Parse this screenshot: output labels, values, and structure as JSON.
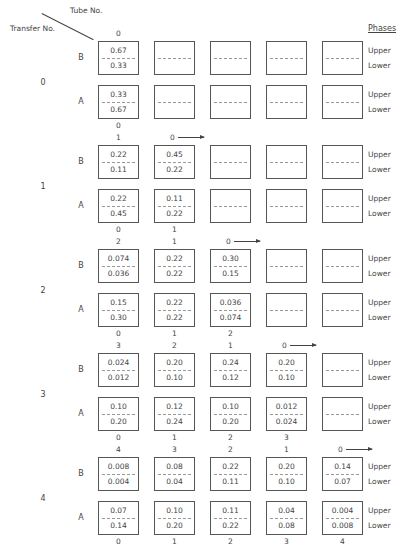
{
  "header": {
    "tube_label": "Tube No.",
    "transfer_label": "Transfer No.",
    "phases_title": "Phases",
    "upper_label": "Upper",
    "lower_label": "Lower"
  },
  "transfers": [
    {
      "number": "0",
      "top_labels": [
        "0",
        "",
        "",
        "",
        ""
      ],
      "arrow_col": null,
      "bottom_labels": [
        "0",
        "",
        "",
        "",
        ""
      ],
      "B": [
        [
          "0.67",
          "0.33"
        ],
        [
          "",
          ""
        ],
        [
          "",
          ""
        ],
        [
          "",
          ""
        ],
        [
          "",
          ""
        ]
      ],
      "A": [
        [
          "0.33",
          "0.67"
        ],
        [
          "",
          ""
        ],
        [
          "",
          ""
        ],
        [
          "",
          ""
        ],
        [
          "",
          ""
        ]
      ]
    },
    {
      "number": "1",
      "top_labels": [
        "1",
        "0",
        "",
        "",
        ""
      ],
      "arrow_col": 1,
      "bottom_labels": [
        "0",
        "1",
        "",
        "",
        ""
      ],
      "B": [
        [
          "0.22",
          "0.11"
        ],
        [
          "0.45",
          "0.22"
        ],
        [
          "",
          ""
        ],
        [
          "",
          ""
        ],
        [
          "",
          ""
        ]
      ],
      "A": [
        [
          "0.22",
          "0.45"
        ],
        [
          "0.11",
          "0.22"
        ],
        [
          "",
          ""
        ],
        [
          "",
          ""
        ],
        [
          "",
          ""
        ]
      ]
    },
    {
      "number": "2",
      "top_labels": [
        "2",
        "1",
        "0",
        "",
        ""
      ],
      "arrow_col": 2,
      "bottom_labels": [
        "0",
        "1",
        "2",
        "",
        ""
      ],
      "B": [
        [
          "0.074",
          "0.036"
        ],
        [
          "0.22",
          "0.22"
        ],
        [
          "0.30",
          "0.15"
        ],
        [
          "",
          ""
        ],
        [
          "",
          ""
        ]
      ],
      "A": [
        [
          "0.15",
          "0.30"
        ],
        [
          "0.22",
          "0.22"
        ],
        [
          "0.036",
          "0.074"
        ],
        [
          "",
          ""
        ],
        [
          "",
          ""
        ]
      ]
    },
    {
      "number": "3",
      "top_labels": [
        "3",
        "2",
        "1",
        "0",
        ""
      ],
      "arrow_col": 3,
      "bottom_labels": [
        "0",
        "1",
        "2",
        "3",
        ""
      ],
      "B": [
        [
          "0.024",
          "0.012"
        ],
        [
          "0.20",
          "0.10"
        ],
        [
          "0.24",
          "0.12"
        ],
        [
          "0.20",
          "0.10"
        ],
        [
          "",
          ""
        ]
      ],
      "A": [
        [
          "0.10",
          "0.20"
        ],
        [
          "0.12",
          "0.24"
        ],
        [
          "0.10",
          "0.20"
        ],
        [
          "0.012",
          "0.024"
        ],
        [
          "",
          ""
        ]
      ]
    },
    {
      "number": "4",
      "top_labels": [
        "4",
        "3",
        "2",
        "1",
        "0"
      ],
      "arrow_col": 4,
      "bottom_labels": [
        "0",
        "1",
        "2",
        "3",
        "4"
      ],
      "B": [
        [
          "0.008",
          "0.004"
        ],
        [
          "0.08",
          "0.04"
        ],
        [
          "0.22",
          "0.11"
        ],
        [
          "0.20",
          "0.10"
        ],
        [
          "0.14",
          "0.07"
        ]
      ],
      "A": [
        [
          "0.07",
          "0.14"
        ],
        [
          "0.10",
          "0.20"
        ],
        [
          "0.11",
          "0.22"
        ],
        [
          "0.04",
          "0.08"
        ],
        [
          "0.004",
          "0.008"
        ]
      ]
    }
  ],
  "phase_letters": {
    "B": "B",
    "A": "A"
  }
}
